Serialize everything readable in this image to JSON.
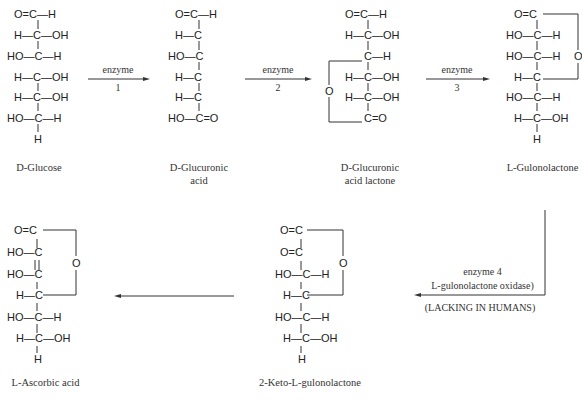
{
  "diagram": {
    "molecules": [
      {
        "name": "D-Glucose",
        "name_l1": "D-Glucose",
        "name_l2": "",
        "rows": [
          "O=C—H",
          "H—C—OH",
          "HO—C—H",
          "H—C—OH",
          "H—C—OH",
          "HO—C—H",
          "H"
        ]
      },
      {
        "name": "D-Glucuronic acid",
        "name_l1": "D-Glucuronic",
        "name_l2": "acid",
        "rows": [
          "O=C—H",
          "H—C",
          "HO—C",
          "H—C",
          "H—C",
          "HO—C=O"
        ]
      },
      {
        "name": "D-Glucuronic acid lactone",
        "name_l1": "D-Glucuronic",
        "name_l2": "acid lactone",
        "rows": [
          "O=C—H",
          "H—C—OH",
          "C—H",
          "H—C—OH",
          "H—C—OH",
          "C=O"
        ],
        "ring_o": "O"
      },
      {
        "name": "L-Gulonolactone",
        "name_l1": "L-Gulonolactone",
        "name_l2": "",
        "rows": [
          "O=C",
          "HO—C—H",
          "HO—C—H",
          "H—C",
          "HO—C—H",
          "H—C—OH",
          "H"
        ],
        "ring_o": "O"
      },
      {
        "name": "2-Keto-L-gulonolactone",
        "name_l1": "2-Keto-L-gulonolactone",
        "name_l2": "",
        "rows": [
          "O=C",
          "O=C",
          "HO—C—H",
          "H—C",
          "HO—C—H",
          "H—C—OH",
          "H"
        ],
        "ring_o": "O"
      },
      {
        "name": "L-Ascorbic acid",
        "name_l1": "L-Ascorbic acid",
        "name_l2": "",
        "rows": [
          "O=C",
          "HO—C",
          "C",
          "HO—C",
          "H—C",
          "HO—C—H",
          "H—C—OH",
          "H"
        ],
        "ring_o": "O"
      }
    ],
    "arrows": [
      {
        "label_top": "enzyme",
        "label_bottom": "1"
      },
      {
        "label_top": "enzyme",
        "label_bottom": "2"
      },
      {
        "label_top": "enzyme",
        "label_bottom": "3"
      },
      {
        "label_top": "enzyme 4",
        "label_bottom": "L-gulonolactone oxidase)",
        "note": "(LACKING IN HUMANS)"
      },
      {
        "label_top": "",
        "label_bottom": ""
      }
    ]
  }
}
